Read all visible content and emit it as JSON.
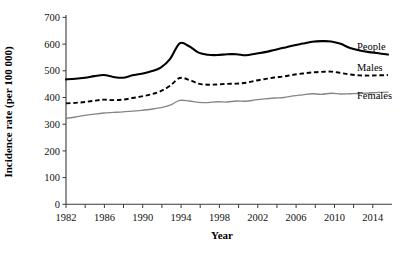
{
  "chart_data": {
    "type": "line",
    "title": "",
    "xlabel": "Year",
    "ylabel": "Incidence rate (per 100 000)",
    "xlim": [
      1982,
      2016
    ],
    "ylim": [
      0,
      700
    ],
    "ytick_labels": [
      "0",
      "100",
      "200",
      "300",
      "400",
      "500",
      "600",
      "700"
    ],
    "ytick_values": [
      0,
      100,
      200,
      300,
      400,
      500,
      600,
      700
    ],
    "xtick_labels": [
      "1982",
      "1986",
      "1990",
      "1994",
      "1998",
      "2002",
      "2006",
      "2010",
      "2014"
    ],
    "xtick_values": [
      1982,
      1986,
      1990,
      1994,
      1998,
      2002,
      2006,
      2010,
      2014
    ],
    "xminor_step": 2,
    "grid": false,
    "legend_position": "right-inline",
    "x": [
      1982,
      1983,
      1984,
      1985,
      1986,
      1987,
      1988,
      1989,
      1990,
      1991,
      1992,
      1993,
      1994,
      1995,
      1996,
      1997,
      1998,
      1999,
      2000,
      2001,
      2002,
      2003,
      2004,
      2005,
      2006,
      2007,
      2008,
      2009,
      2010,
      2011,
      2012,
      2013,
      2014,
      2015,
      2016
    ],
    "series": [
      {
        "name": "People",
        "style": "solid",
        "color": "#000000",
        "values": [
          468,
          470,
          474,
          480,
          484,
          477,
          474,
          483,
          489,
          498,
          512,
          545,
          603,
          592,
          568,
          560,
          559,
          562,
          562,
          558,
          564,
          570,
          578,
          586,
          595,
          602,
          609,
          611,
          610,
          601,
          585,
          576,
          570,
          566,
          561
        ]
      },
      {
        "name": "Males",
        "style": "dashed",
        "color": "#000000",
        "values": [
          378,
          380,
          383,
          388,
          392,
          390,
          392,
          398,
          404,
          412,
          424,
          444,
          473,
          466,
          452,
          448,
          449,
          451,
          452,
          455,
          463,
          469,
          475,
          479,
          485,
          490,
          494,
          496,
          497,
          492,
          486,
          483,
          482,
          483,
          484
        ]
      },
      {
        "name": "Females",
        "style": "solid",
        "color": "#868686",
        "values": [
          322,
          327,
          333,
          338,
          342,
          344,
          346,
          349,
          352,
          356,
          362,
          371,
          389,
          387,
          382,
          381,
          384,
          383,
          387,
          386,
          391,
          395,
          398,
          400,
          406,
          410,
          414,
          412,
          416,
          413,
          414,
          415,
          417,
          419,
          420
        ]
      }
    ]
  },
  "series_labels": {
    "people": "People",
    "males": "Males",
    "females": "Females"
  }
}
